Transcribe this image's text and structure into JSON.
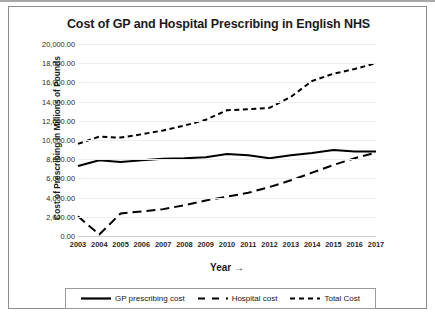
{
  "chart_data": {
    "type": "line",
    "title": "Cost of GP and Hospital Prescribing  in English NHS",
    "xlabel": "Year →",
    "ylabel": "Cost of Prescribing in Millions of Pounds",
    "categories": [
      "2003",
      "2004",
      "2005",
      "2006",
      "2007",
      "2008",
      "2009",
      "2010",
      "2011",
      "2012",
      "2013",
      "2014",
      "2015",
      "2016",
      "2017"
    ],
    "ylim": [
      0,
      20000
    ],
    "ytick_labels": [
      "20,000.00",
      "18,000.00",
      "16,000.00",
      "14,000.00",
      "12,000.00",
      "10,000.00",
      "8,000.00",
      "6,000.00",
      "4,000.00",
      "2,000.00",
      "0.00"
    ],
    "ytick_values": [
      20000,
      18000,
      16000,
      14000,
      12000,
      10000,
      8000,
      6000,
      4000,
      2000,
      0
    ],
    "grid": true,
    "legend_position": "bottom",
    "series": [
      {
        "name": "GP prescribing cost",
        "style": "solid",
        "color": "#000000",
        "values": [
          7300,
          7900,
          7700,
          7900,
          8050,
          8100,
          8200,
          8550,
          8400,
          8100,
          8400,
          8650,
          8950,
          8800,
          8800
        ]
      },
      {
        "name": "Hospital cost",
        "style": "long-dash",
        "color": "#000000",
        "values": [
          2050,
          150,
          2350,
          2550,
          2800,
          3200,
          3700,
          4100,
          4500,
          5100,
          5800,
          6600,
          7400,
          8100,
          8700
        ]
      },
      {
        "name": "Total Cost",
        "style": "short-dash",
        "color": "#000000",
        "values": [
          9600,
          10350,
          10250,
          10600,
          11000,
          11500,
          12100,
          13100,
          13200,
          13350,
          14500,
          16150,
          16900,
          17400,
          18000
        ]
      }
    ]
  },
  "legend": {
    "items": [
      {
        "label": "GP prescribing cost"
      },
      {
        "label": "Hospital cost"
      },
      {
        "label": "Total Cost"
      }
    ]
  }
}
